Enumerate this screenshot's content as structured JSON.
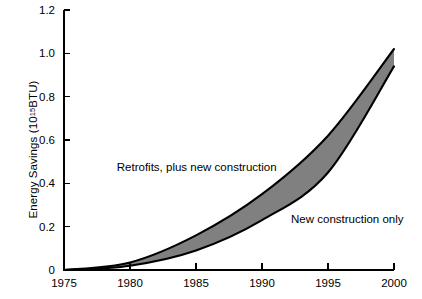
{
  "chart_data": {
    "type": "area",
    "title": "",
    "xlabel": "",
    "ylabel_prefix": "Energy Savings (10",
    "ylabel_exponent": "15",
    "ylabel_suffix": " BTU)",
    "ylabel_full": "Energy Savings (10^15 BTU)",
    "x": [
      1975,
      1980,
      1985,
      1990,
      1995,
      2000
    ],
    "xlim": [
      1975,
      2000
    ],
    "ylim": [
      0,
      1.2
    ],
    "xticks": [
      "1975",
      "1980",
      "1985",
      "1990",
      "1995",
      "2000"
    ],
    "yticks": [
      "0",
      "0.2",
      "0.4",
      "0.6",
      "0.8",
      "1.0",
      "1.2"
    ],
    "ytick_values": [
      0,
      0.2,
      0.4,
      0.6,
      0.8,
      1.0,
      1.2
    ],
    "grid": false,
    "legend_position": "inline-annotations",
    "fill_color": "#808080",
    "line_color": "#000000",
    "series": [
      {
        "name": "Retrofits, plus new construction",
        "annotation": "Retrofits, plus new construction",
        "values": [
          0.0,
          0.035,
          0.16,
          0.35,
          0.62,
          1.02
        ]
      },
      {
        "name": "New construction only",
        "annotation": "New construction only",
        "values": [
          0.0,
          0.02,
          0.09,
          0.23,
          0.45,
          0.94
        ]
      }
    ],
    "annotations": [
      {
        "text": "Retrofits, plus new construction",
        "x": 1979.0,
        "y": 0.455
      },
      {
        "text": "New construction only",
        "x": 1992.2,
        "y": 0.215
      }
    ]
  }
}
